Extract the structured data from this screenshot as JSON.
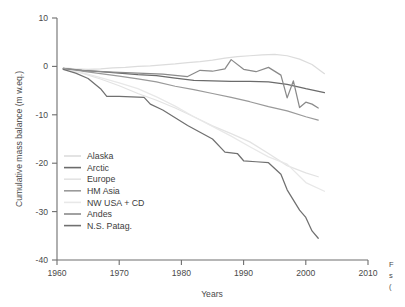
{
  "chart_data": {
    "type": "line",
    "title": "",
    "xlabel": "Years",
    "ylabel": "Cumulative mass balance (m w.eq.)",
    "xlim": [
      1960,
      2010
    ],
    "ylim": [
      -40,
      10
    ],
    "xticks": [
      1960,
      1970,
      1980,
      1990,
      2000,
      2010
    ],
    "yticks": [
      10,
      0,
      -10,
      -20,
      -30,
      -40
    ],
    "grid": false,
    "legend_position": "lower-left-inside",
    "series": [
      {
        "name": "Alaska",
        "color": "#dcdcdc",
        "x": [
          1961,
          1963,
          1965,
          1967,
          1969,
          1971,
          1973,
          1975,
          1977,
          1979,
          1981,
          1983,
          1985,
          1987,
          1989,
          1991,
          1993,
          1995,
          1997,
          1999,
          2001,
          2003
        ],
        "values": [
          -0.3,
          -0.5,
          -0.6,
          -0.5,
          -0.3,
          -0.2,
          0.0,
          0.1,
          0.3,
          0.5,
          0.8,
          1.0,
          1.3,
          1.7,
          2.0,
          2.2,
          2.4,
          2.5,
          2.2,
          1.5,
          0.4,
          -1.5
        ]
      },
      {
        "name": "Arctic",
        "color": "#6b6b6b",
        "x": [
          1961,
          1964,
          1967,
          1970,
          1973,
          1976,
          1979,
          1982,
          1985,
          1988,
          1991,
          1994,
          1997,
          2000,
          2003
        ],
        "values": [
          -0.4,
          -0.8,
          -1.1,
          -1.4,
          -1.7,
          -1.9,
          -2.4,
          -2.9,
          -3.0,
          -3.1,
          -3.1,
          -3.2,
          -3.7,
          -4.6,
          -5.4
        ]
      },
      {
        "name": "Europe",
        "color": "#e3e3e3",
        "x": [
          1961,
          1964,
          1967,
          1970,
          1973,
          1976,
          1979,
          1982,
          1985,
          1988,
          1991,
          1994,
          1997,
          2000,
          2002
        ],
        "values": [
          -0.5,
          -1.4,
          -2.6,
          -4.0,
          -5.6,
          -7.0,
          -8.6,
          -10.4,
          -12.3,
          -13.9,
          -15.6,
          -18.0,
          -20.5,
          -22.0,
          -22.8
        ]
      },
      {
        "name": "HM Asia",
        "color": "#9a9a9a",
        "x": [
          1961,
          1964,
          1967,
          1970,
          1973,
          1976,
          1979,
          1982,
          1985,
          1988,
          1991,
          1994,
          1997,
          2000,
          2002
        ],
        "values": [
          -0.4,
          -1.0,
          -1.5,
          -2.0,
          -2.6,
          -3.2,
          -4.1,
          -4.8,
          -5.6,
          -6.4,
          -7.3,
          -8.3,
          -9.2,
          -10.4,
          -11.1
        ]
      },
      {
        "name": "NW USA + CD",
        "color": "#e8e8e8",
        "x": [
          1961,
          1964,
          1967,
          1970,
          1973,
          1976,
          1979,
          1982,
          1985,
          1988,
          1991,
          1994,
          1997,
          2000,
          2003
        ],
        "values": [
          -0.5,
          -1.3,
          -2.3,
          -3.4,
          -4.6,
          -6.3,
          -8.2,
          -10.4,
          -12.4,
          -14.4,
          -16.6,
          -18.7,
          -20.2,
          -24.0,
          -25.8
        ]
      },
      {
        "name": "Andes",
        "color": "#8a8a8a",
        "x": [
          1961,
          1965,
          1969,
          1973,
          1977,
          1981,
          1983,
          1985,
          1987,
          1988,
          1990,
          1992,
          1994,
          1996,
          1997,
          1998,
          1999,
          2000,
          2001,
          2002
        ],
        "values": [
          -0.5,
          -0.9,
          -1.2,
          -1.4,
          -1.6,
          -2.1,
          -0.8,
          -1.0,
          -0.5,
          1.4,
          -0.6,
          -1.1,
          -0.2,
          -1.8,
          -6.5,
          -3.0,
          -8.5,
          -7.4,
          -7.8,
          -8.6
        ]
      },
      {
        "name": "N.S. Patag.",
        "color": "#707070",
        "x": [
          1961,
          1963,
          1965,
          1967,
          1968,
          1970,
          1972,
          1974,
          1975,
          1977,
          1979,
          1981,
          1983,
          1985,
          1987,
          1989,
          1990,
          1992,
          1994,
          1996,
          1997,
          1999,
          2000,
          2001,
          2002
        ],
        "values": [
          -0.6,
          -1.4,
          -2.5,
          -4.6,
          -6.2,
          -6.2,
          -6.3,
          -6.4,
          -7.8,
          -9.0,
          -10.6,
          -12.2,
          -13.6,
          -15.0,
          -17.7,
          -18.0,
          -19.5,
          -19.7,
          -19.9,
          -22.3,
          -25.5,
          -29.7,
          -31.2,
          -34.0,
          -35.5
        ]
      }
    ]
  },
  "axes": {
    "y_label": "Cumulative mass balance (m w.eq.)",
    "x_label": "Years",
    "x_tick_labels": [
      "1960",
      "1970",
      "1980",
      "1990",
      "2000",
      "2010"
    ],
    "y_tick_labels": [
      "10",
      "0",
      "-10",
      "-20",
      "-30",
      "-40"
    ]
  },
  "legend": {
    "items": [
      {
        "label": "Alaska"
      },
      {
        "label": "Arctic"
      },
      {
        "label": "Europe"
      },
      {
        "label": "HM Asia"
      },
      {
        "label": "NW USA + CD"
      },
      {
        "label": "Andes"
      },
      {
        "label": "N.S. Patag."
      }
    ]
  },
  "caption_fragment": {
    "line1": "F",
    "line2": "s",
    "line3": "("
  }
}
